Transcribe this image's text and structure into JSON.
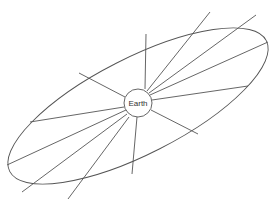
{
  "diagram": {
    "center_label": "Earth",
    "stroke_color": "#555555",
    "background": "#ffffff",
    "ellipse": {
      "cx": 138,
      "cy": 106,
      "rx": 144,
      "ry": 48,
      "rotation_deg": -27
    },
    "earth_circle": {
      "cx": 138,
      "cy": 103,
      "r": 14
    },
    "radial_lines": [
      {
        "x1": 145,
        "y1": 89,
        "x2": 146,
        "y2": 34
      },
      {
        "x1": 125,
        "y1": 97,
        "x2": 79,
        "y2": 73
      },
      {
        "x1": 124,
        "y1": 107,
        "x2": 30,
        "y2": 122
      },
      {
        "x1": 126,
        "y1": 110,
        "x2": 7,
        "y2": 165
      },
      {
        "x1": 127,
        "y1": 114,
        "x2": 22,
        "y2": 192
      },
      {
        "x1": 129,
        "y1": 117,
        "x2": 68,
        "y2": 199
      },
      {
        "x1": 137,
        "y1": 117,
        "x2": 132,
        "y2": 174
      },
      {
        "x1": 151,
        "y1": 110,
        "x2": 198,
        "y2": 134
      },
      {
        "x1": 152,
        "y1": 100,
        "x2": 248,
        "y2": 86
      },
      {
        "x1": 150,
        "y1": 95,
        "x2": 268,
        "y2": 42
      },
      {
        "x1": 149,
        "y1": 93,
        "x2": 256,
        "y2": 15
      },
      {
        "x1": 147,
        "y1": 91,
        "x2": 210,
        "y2": 12
      }
    ]
  }
}
